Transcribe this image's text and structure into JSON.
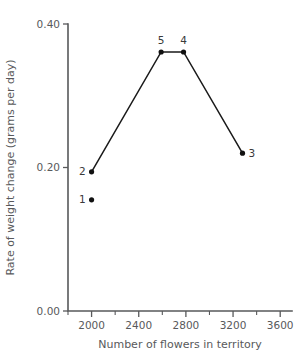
{
  "chart_data": {
    "type": "line",
    "title": "",
    "xlabel": "Number of flowers in territory",
    "ylabel": "Rate of weight change (grams per day)",
    "xlim": [
      1800,
      3700
    ],
    "ylim": [
      0.0,
      0.4
    ],
    "grid": false,
    "legend": "none",
    "x_ticks": [
      2000,
      2400,
      2800,
      3200,
      3600
    ],
    "x_tick_labels": [
      "2000",
      "2400",
      "2800",
      "3200",
      "3600"
    ],
    "x_minor_ticks": [
      1800,
      2200,
      2600,
      3000,
      3400
    ],
    "y_ticks": [
      0.0,
      0.2,
      0.4
    ],
    "y_tick_labels": [
      "0.00",
      "0.20",
      "0.40"
    ],
    "points": [
      {
        "label": "1",
        "x": 2000,
        "y": 0.155,
        "connected": false,
        "label_pos": "left"
      },
      {
        "label": "2",
        "x": 2000,
        "y": 0.194,
        "connected": true,
        "label_pos": "left"
      },
      {
        "label": "5",
        "x": 2590,
        "y": 0.361,
        "connected": true,
        "label_pos": "above"
      },
      {
        "label": "4",
        "x": 2780,
        "y": 0.361,
        "connected": true,
        "label_pos": "above"
      },
      {
        "label": "3",
        "x": 3280,
        "y": 0.22,
        "connected": true,
        "label_pos": "right"
      }
    ],
    "line_order": [
      "2",
      "5",
      "4",
      "3"
    ]
  }
}
